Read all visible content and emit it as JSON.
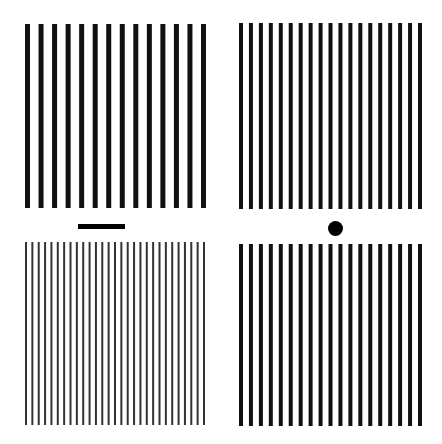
{
  "figure": {
    "width": 442,
    "height": 444,
    "background": "#ffffff",
    "panels": [
      {
        "id": "top-left",
        "description": "thick vertical grating",
        "x": 25,
        "y": 24,
        "width": 181,
        "height": 184,
        "bar_count": 14,
        "bar_width": 5,
        "bar_color": "#111111"
      },
      {
        "id": "top-right",
        "description": "medium vertical grating",
        "x": 239,
        "y": 23,
        "width": 183,
        "height": 186,
        "bar_count": 19,
        "bar_width": 4,
        "bar_color": "#111111"
      },
      {
        "id": "bottom-left",
        "description": "thin vertical grating",
        "x": 25,
        "y": 242,
        "width": 180,
        "height": 183,
        "bar_count": 29,
        "bar_width": 2,
        "bar_color": "#333333"
      },
      {
        "id": "bottom-right",
        "description": "medium vertical grating",
        "x": 239,
        "y": 244,
        "width": 183,
        "height": 182,
        "bar_count": 19,
        "bar_width": 4,
        "bar_color": "#111111"
      }
    ],
    "markers": {
      "bar": {
        "x": 78,
        "y": 224,
        "width": 47,
        "height": 5,
        "color": "#000000"
      },
      "dot": {
        "cx": 335,
        "cy": 228,
        "diameter": 15,
        "color": "#000000"
      }
    }
  }
}
